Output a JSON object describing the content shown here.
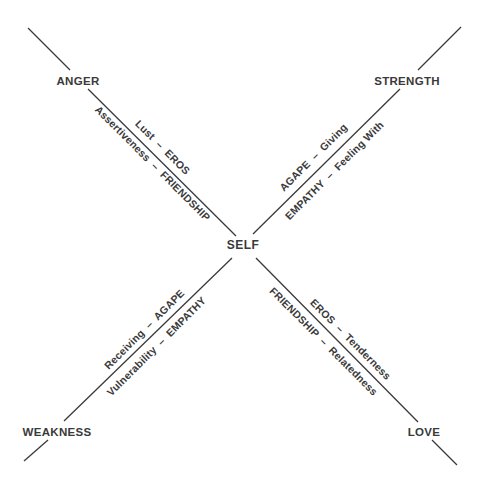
{
  "diagram": {
    "center": {
      "label": "SELF",
      "x": 243,
      "y": 249
    },
    "poles": [
      {
        "id": "anger",
        "label": "ANGER",
        "x": 78,
        "y": 85
      },
      {
        "id": "strength",
        "label": "STRENGTH",
        "x": 407,
        "y": 85
      },
      {
        "id": "weakness",
        "label": "WEAKNESS",
        "x": 57,
        "y": 436
      },
      {
        "id": "love",
        "label": "LOVE",
        "x": 424,
        "y": 436
      }
    ],
    "lines": [
      {
        "id": "line-anger-outer",
        "x1": 28,
        "y1": 28,
        "x2": 70,
        "y2": 70
      },
      {
        "id": "line-anger-self",
        "x1": 88,
        "y1": 89,
        "x2": 236,
        "y2": 236
      },
      {
        "id": "line-self-love",
        "x1": 256,
        "y1": 258,
        "x2": 418,
        "y2": 422
      },
      {
        "id": "line-love-outer",
        "x1": 432,
        "y1": 440,
        "x2": 457,
        "y2": 465
      },
      {
        "id": "line-strength-outer",
        "x1": 461,
        "y1": 27,
        "x2": 418,
        "y2": 70
      },
      {
        "id": "line-strength-self",
        "x1": 400,
        "y1": 89,
        "x2": 253,
        "y2": 234
      },
      {
        "id": "line-self-weakness",
        "x1": 232,
        "y1": 258,
        "x2": 64,
        "y2": 421
      },
      {
        "id": "line-weakness-outer",
        "x1": 48,
        "y1": 440,
        "x2": 24,
        "y2": 461
      }
    ],
    "axis_labels": [
      {
        "id": "lust-eros",
        "text": "Lust  –  EROS",
        "x": 162,
        "y": 148,
        "angle": 45
      },
      {
        "id": "assertiveness-friendship",
        "text": "Assertiveness  –  FRIENDSHIP",
        "x": 152,
        "y": 164,
        "angle": 45
      },
      {
        "id": "agape-giving",
        "text": "AGAPE  –  Giving",
        "x": 314,
        "y": 158,
        "angle": -45
      },
      {
        "id": "empathy-feeling-with",
        "text": "EMPATHY  –  Feeling With",
        "x": 335,
        "y": 171,
        "angle": -45
      },
      {
        "id": "receiving-agape",
        "text": "Receiving  –  AGAPE",
        "x": 145,
        "y": 330,
        "angle": -45
      },
      {
        "id": "vulnerability-empathy",
        "text": "Vulnerability  –  EMPATHY",
        "x": 157,
        "y": 347,
        "angle": -45
      },
      {
        "id": "eros-tenderness",
        "text": "EROS  –  Tenderness",
        "x": 350,
        "y": 340,
        "angle": 45
      },
      {
        "id": "friendship-relatedness",
        "text": "FRIENDSHIP  –  Relatedness",
        "x": 323,
        "y": 342,
        "angle": 45
      }
    ]
  }
}
